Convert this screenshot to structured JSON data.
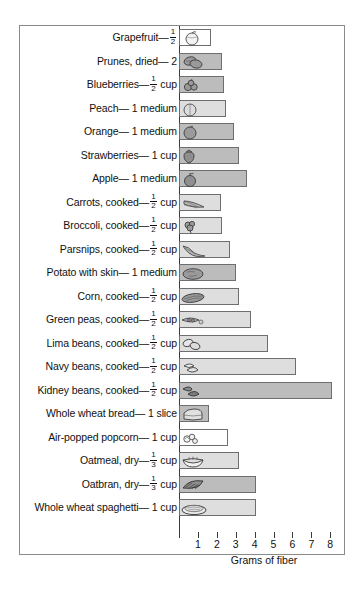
{
  "chart_data": {
    "type": "bar",
    "orientation": "horizontal",
    "title": "",
    "xlabel": "Grams of fiber",
    "ylabel": "",
    "xlim": [
      0,
      8.4
    ],
    "xticks": [
      1,
      2,
      3,
      4,
      5,
      6,
      7,
      8
    ],
    "grid": false,
    "legend": null,
    "categories": [
      "Grapefruit— 1/2",
      "Prunes, dried— 2",
      "Blueberries— 1/2 cup",
      "Peach— 1 medium",
      "Orange— 1 medium",
      "Strawberries— 1 cup",
      "Apple— 1 medium",
      "Carrots, cooked— 1/2 cup",
      "Broccoli, cooked— 1/2 cup",
      "Parsnips, cooked— 1/2 cup",
      "Potato with skin— 1 medium",
      "Corn, cooked— 1/2 cup",
      "Green peas, cooked— 1/2 cup",
      "Lima beans, cooked— 1/2 cup",
      "Navy beans, cooked— 1/2 cup",
      "Kidney beans, cooked— 1/2 cup",
      "Whole wheat bread— 1 slice",
      "Air-popped popcorn— 1 cup",
      "Oatmeal, dry— 1/3 cup",
      "Oatbran, dry— 1/3 cup",
      "Whole wheat spaghetti— 1 cup"
    ],
    "values": [
      1.7,
      2.3,
      2.4,
      2.5,
      2.9,
      3.2,
      3.6,
      2.2,
      2.3,
      2.7,
      3.0,
      3.2,
      3.8,
      4.7,
      6.2,
      8.1,
      1.6,
      2.6,
      3.2,
      4.1,
      4.1
    ]
  },
  "rows": [
    {
      "name": "grapefruit",
      "pre": "Grapefruit—",
      "num": "1",
      "den": "2",
      "post": "",
      "value": 1.7,
      "fill": "white",
      "glyph": "grapefruit"
    },
    {
      "name": "prunes",
      "pre": "Prunes, dried— 2",
      "num": "",
      "den": "",
      "post": "",
      "value": 2.3,
      "fill": "dark",
      "glyph": "prunes"
    },
    {
      "name": "blueberries",
      "pre": "Blueberries—",
      "num": "1",
      "den": "2",
      "post": " cup",
      "value": 2.4,
      "fill": "dark",
      "glyph": "blueberries"
    },
    {
      "name": "peach",
      "pre": "Peach— 1 medium",
      "num": "",
      "den": "",
      "post": "",
      "value": 2.5,
      "fill": "light",
      "glyph": "peach"
    },
    {
      "name": "orange",
      "pre": "Orange— 1 medium",
      "num": "",
      "den": "",
      "post": "",
      "value": 2.9,
      "fill": "dark",
      "glyph": "orange"
    },
    {
      "name": "strawberries",
      "pre": "Strawberries— 1 cup",
      "num": "",
      "den": "",
      "post": "",
      "value": 3.2,
      "fill": "dark",
      "glyph": "strawberry"
    },
    {
      "name": "apple",
      "pre": "Apple— 1 medium",
      "num": "",
      "den": "",
      "post": "",
      "value": 3.6,
      "fill": "dark",
      "glyph": "apple"
    },
    {
      "name": "carrots",
      "pre": "Carrots, cooked—",
      "num": "1",
      "den": "2",
      "post": " cup",
      "value": 2.2,
      "fill": "light",
      "glyph": "carrots"
    },
    {
      "name": "broccoli",
      "pre": "Broccoli, cooked—",
      "num": "1",
      "den": "2",
      "post": " cup",
      "value": 2.3,
      "fill": "light",
      "glyph": "broccoli"
    },
    {
      "name": "parsnips",
      "pre": "Parsnips, cooked—",
      "num": "1",
      "den": "2",
      "post": " cup",
      "value": 2.7,
      "fill": "light",
      "glyph": "parsnips"
    },
    {
      "name": "potato",
      "pre": "Potato with skin— 1 medium",
      "num": "",
      "den": "",
      "post": "",
      "value": 3.0,
      "fill": "dark",
      "glyph": "potato"
    },
    {
      "name": "corn",
      "pre": "Corn, cooked—",
      "num": "1",
      "den": "2",
      "post": " cup",
      "value": 3.2,
      "fill": "light",
      "glyph": "corn"
    },
    {
      "name": "green-peas",
      "pre": "Green peas, cooked—",
      "num": "1",
      "den": "2",
      "post": " cup",
      "value": 3.8,
      "fill": "light",
      "glyph": "peas"
    },
    {
      "name": "lima-beans",
      "pre": "Lima beans, cooked—",
      "num": "1",
      "den": "2",
      "post": " cup",
      "value": 4.7,
      "fill": "light",
      "glyph": "lima"
    },
    {
      "name": "navy-beans",
      "pre": "Navy beans, cooked—",
      "num": "1",
      "den": "2",
      "post": " cup",
      "value": 6.2,
      "fill": "light",
      "glyph": "navy"
    },
    {
      "name": "kidney-beans",
      "pre": "Kidney beans, cooked—",
      "num": "1",
      "den": "2",
      "post": " cup",
      "value": 8.1,
      "fill": "dark",
      "glyph": "kidney"
    },
    {
      "name": "whole-wheat-bread",
      "pre": "Whole wheat bread— 1 slice",
      "num": "",
      "den": "",
      "post": "",
      "value": 1.6,
      "fill": "dark",
      "glyph": "bread"
    },
    {
      "name": "popcorn",
      "pre": "Air-popped popcorn— 1 cup",
      "num": "",
      "den": "",
      "post": "",
      "value": 2.6,
      "fill": "white",
      "glyph": "popcorn"
    },
    {
      "name": "oatmeal",
      "pre": "Oatmeal, dry—",
      "num": "1",
      "den": "3",
      "post": " cup",
      "value": 3.2,
      "fill": "light",
      "glyph": "oatmeal"
    },
    {
      "name": "oatbran",
      "pre": "Oatbran, dry—",
      "num": "1",
      "den": "3",
      "post": " cup",
      "value": 4.1,
      "fill": "dark",
      "glyph": "oatbran"
    },
    {
      "name": "spaghetti",
      "pre": "Whole wheat spaghetti— 1 cup",
      "num": "",
      "den": "",
      "post": "",
      "value": 4.1,
      "fill": "light",
      "glyph": "spaghetti"
    }
  ],
  "axis": {
    "ticks": [
      "1",
      "2",
      "3",
      "4",
      "5",
      "6",
      "7",
      "8"
    ],
    "title": "Grams of fiber"
  },
  "colors": {
    "bar_dark": "#c9c9c9",
    "bar_light": "#dedede",
    "bar_white": "#ffffff",
    "bar_border": "#6e6e6e",
    "frame": "#8a8a8a",
    "axis": "#3a3a3a",
    "text": "#111111"
  }
}
